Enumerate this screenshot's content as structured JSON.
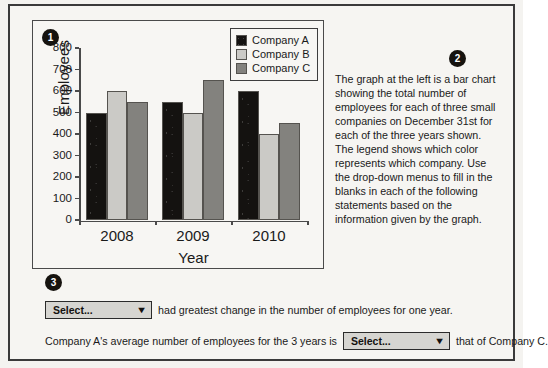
{
  "badges": {
    "one": "1",
    "two": "2",
    "three": "3"
  },
  "chart_data": {
    "type": "bar",
    "title": "",
    "xlabel": "Year",
    "ylabel": "Employees",
    "categories": [
      "2008",
      "2009",
      "2010"
    ],
    "series": [
      {
        "name": "Company A",
        "color": "#141210",
        "values": [
          500,
          550,
          600
        ]
      },
      {
        "name": "Company B",
        "color": "#cbcac6",
        "values": [
          600,
          500,
          400
        ]
      },
      {
        "name": "Company C",
        "color": "#83827e",
        "values": [
          550,
          650,
          450
        ]
      }
    ],
    "ylim": [
      0,
      800
    ],
    "ytick_labels": [
      "800",
      "700",
      "600",
      "500",
      "400",
      "300",
      "200",
      "100",
      "0"
    ],
    "ytick_values": [
      800,
      700,
      600,
      500,
      400,
      300,
      200,
      100,
      0
    ],
    "grid": false,
    "legend_position": "top-right",
    "legend_entries": [
      "Company A",
      "Company B",
      "Company C"
    ]
  },
  "description": {
    "paragraph": "The graph at the left is a bar chart showing the total number of employees for each of three small companies on December 31st for each of the three years shown. The legend shows which color represents which company. Use the drop-down menus to fill in the blanks in each of the following statements based on the information given by the graph."
  },
  "questions": {
    "statement_1": {
      "dropdown_value": "Select...",
      "text_after": "had greatest change in the number of employees for one year."
    },
    "statement_2": {
      "text_before": "Company A's average number of employees for the 3 years is",
      "dropdown_value": "Select...",
      "text_after": "that of Company C."
    },
    "dropdown_arrow": "▼"
  }
}
